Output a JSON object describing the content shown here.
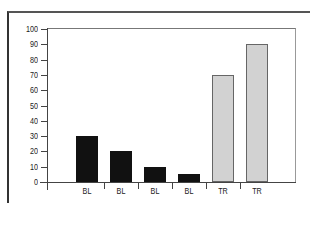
{
  "chart_data": {
    "type": "bar",
    "title": "",
    "xlabel": "",
    "ylabel": "",
    "categories": [
      "BL",
      "BL",
      "BL",
      "BL",
      "TR",
      "TR"
    ],
    "values": [
      30,
      20,
      10,
      5,
      70,
      90
    ],
    "colors": [
      "#111111",
      "#111111",
      "#111111",
      "#111111",
      "#d2d2d2",
      "#d2d2d2"
    ],
    "ylim": [
      0,
      100
    ],
    "yticks": [
      "0",
      "10",
      "20",
      "30",
      "40",
      "50",
      "60",
      "70",
      "80",
      "90",
      "100"
    ],
    "grid": false,
    "legend": null
  }
}
